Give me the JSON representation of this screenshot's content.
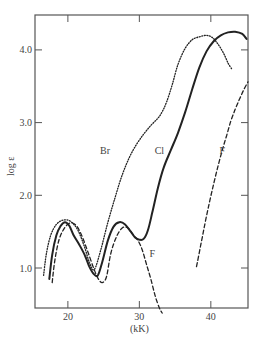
{
  "chart_data": {
    "type": "line",
    "title": "",
    "xlabel": "(kK)",
    "ylabel": "log ε",
    "xlim": [
      15.4,
      45.2
    ],
    "ylim": [
      0.45,
      4.48
    ],
    "grid": false,
    "legend": "inline curve labels",
    "xticks": [
      20,
      30,
      40
    ],
    "xtick_labels": [
      "20",
      "30",
      "40"
    ],
    "yticks": [
      1.0,
      2.0,
      3.0,
      4.0
    ],
    "ytick_labels": [
      "1.0",
      "2.0",
      "3.0",
      "4.0"
    ],
    "series": [
      {
        "name": "Br",
        "style": "dotted",
        "label_pos": [
          25.2,
          2.57
        ],
        "x": [
          16.6,
          17.0,
          17.6,
          18.4,
          19.4,
          20.4,
          21.4,
          22.3,
          23.0,
          23.7,
          24.6,
          25.6,
          26.6,
          27.6,
          28.6,
          29.6,
          30.6,
          31.6,
          32.6,
          33.2,
          33.8,
          34.6,
          35.4,
          36.4,
          37.4,
          38.4,
          39.4,
          40.2,
          41.0,
          41.8,
          42.4,
          42.9
        ],
        "y": [
          0.9,
          1.2,
          1.45,
          1.6,
          1.66,
          1.64,
          1.52,
          1.3,
          1.08,
          0.98,
          1.25,
          1.63,
          1.97,
          2.28,
          2.52,
          2.7,
          2.84,
          2.96,
          3.06,
          3.15,
          3.28,
          3.52,
          3.8,
          4.02,
          4.14,
          4.18,
          4.2,
          4.17,
          4.08,
          3.95,
          3.82,
          3.74
        ]
      },
      {
        "name": "Cl",
        "style": "solid",
        "label_pos": [
          32.8,
          2.57
        ],
        "x": [
          17.4,
          17.8,
          18.4,
          19.0,
          19.6,
          20.2,
          20.8,
          21.6,
          22.4,
          23.0,
          23.6,
          24.2,
          24.8,
          25.6,
          26.4,
          27.2,
          28.0,
          28.8,
          29.4,
          30.0,
          30.6,
          31.2,
          31.8,
          32.6,
          33.4,
          34.4,
          35.4,
          36.4,
          37.4,
          38.4,
          39.4,
          40.4,
          41.4,
          42.4,
          43.4,
          44.4,
          45.0
        ],
        "y": [
          0.85,
          1.18,
          1.45,
          1.58,
          1.63,
          1.58,
          1.45,
          1.32,
          1.17,
          1.02,
          0.92,
          0.9,
          1.08,
          1.38,
          1.57,
          1.63,
          1.6,
          1.5,
          1.42,
          1.39,
          1.4,
          1.52,
          1.76,
          2.1,
          2.38,
          2.62,
          2.86,
          3.14,
          3.46,
          3.76,
          3.98,
          4.12,
          4.2,
          4.24,
          4.25,
          4.22,
          4.15
        ]
      },
      {
        "name": "F",
        "style": "dashed",
        "label_pos": [
          31.8,
          1.15
        ],
        "segment": "low-energy",
        "x": [
          17.8,
          18.2,
          18.8,
          19.6,
          20.4,
          21.2,
          22.0,
          22.8,
          23.6,
          24.2,
          24.8,
          25.4,
          26.0,
          26.8,
          27.6,
          28.4,
          29.2,
          29.8,
          30.4,
          31.0,
          31.6,
          32.2,
          32.8,
          33.2
        ],
        "y": [
          0.8,
          1.12,
          1.4,
          1.56,
          1.62,
          1.58,
          1.43,
          1.22,
          1.0,
          0.86,
          0.8,
          0.88,
          1.2,
          1.43,
          1.55,
          1.55,
          1.45,
          1.38,
          1.25,
          1.05,
          0.85,
          0.62,
          0.45,
          0.38
        ]
      },
      {
        "name": "F",
        "style": "dashed",
        "label_pos": [
          41.6,
          2.57
        ],
        "segment": "high-energy",
        "x": [
          38.0,
          38.6,
          39.2,
          39.8,
          40.4,
          41.0,
          41.6,
          42.2,
          42.8,
          43.4,
          44.0,
          44.6,
          45.2
        ],
        "y": [
          1.02,
          1.32,
          1.62,
          1.9,
          2.16,
          2.4,
          2.62,
          2.82,
          3.02,
          3.18,
          3.32,
          3.45,
          3.56
        ]
      }
    ]
  }
}
